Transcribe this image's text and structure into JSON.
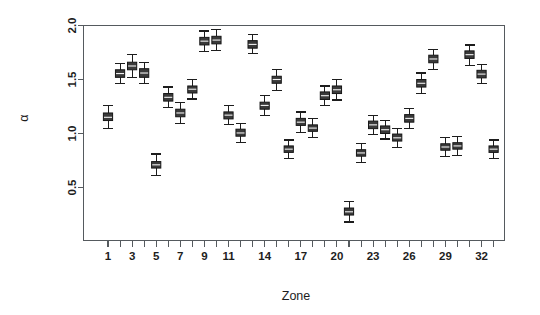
{
  "chart_data": {
    "type": "box",
    "title": "",
    "subtitle": "",
    "xlabel": "Zone",
    "ylabel": "α",
    "xlim": [
      0.5,
      33.5
    ],
    "ylim": [
      0.1,
      2.05
    ],
    "grid": false,
    "legend": null,
    "y_ticks": [
      0.5,
      1.0,
      1.5,
      2.0
    ],
    "y_tick_labels": [
      "0.5",
      "1.0",
      "1.5",
      "2.0"
    ],
    "x_ticks": [
      1,
      2,
      3,
      4,
      5,
      6,
      7,
      8,
      9,
      10,
      11,
      12,
      13,
      14,
      15,
      16,
      17,
      18,
      19,
      20,
      21,
      22,
      23,
      24,
      25,
      26,
      27,
      28,
      29,
      30,
      31,
      32,
      33
    ],
    "x_tick_labels": [
      "1",
      "",
      "3",
      "",
      "5",
      "",
      "7",
      "",
      "9",
      "",
      "11",
      "",
      "",
      "14",
      "",
      "",
      "17",
      "",
      "",
      "20",
      "",
      "",
      "23",
      "",
      "",
      "26",
      "",
      "",
      "29",
      "",
      "",
      "32",
      ""
    ],
    "categories": [
      "1",
      "2",
      "3",
      "4",
      "5",
      "6",
      "7",
      "8",
      "9",
      "10",
      "11",
      "12",
      "13",
      "14",
      "15",
      "16",
      "17",
      "18",
      "19",
      "20",
      "21",
      "22",
      "23",
      "24",
      "25",
      "26",
      "27",
      "28",
      "29",
      "30",
      "31",
      "32",
      "33"
    ],
    "boxes": [
      {
        "zone": 1,
        "lower_whisker": 1.05,
        "q1": 1.12,
        "median": 1.15,
        "q3": 1.19,
        "upper_whisker": 1.26
      },
      {
        "zone": 2,
        "lower_whisker": 1.46,
        "q1": 1.52,
        "median": 1.555,
        "q3": 1.59,
        "upper_whisker": 1.65
      },
      {
        "zone": 3,
        "lower_whisker": 1.52,
        "q1": 1.59,
        "median": 1.625,
        "q3": 1.66,
        "upper_whisker": 1.73
      },
      {
        "zone": 4,
        "lower_whisker": 1.46,
        "q1": 1.52,
        "median": 1.56,
        "q3": 1.6,
        "upper_whisker": 1.66
      },
      {
        "zone": 5,
        "lower_whisker": 0.61,
        "q1": 0.68,
        "median": 0.71,
        "q3": 0.74,
        "upper_whisker": 0.81
      },
      {
        "zone": 6,
        "lower_whisker": 1.24,
        "q1": 1.3,
        "median": 1.335,
        "q3": 1.37,
        "upper_whisker": 1.43
      },
      {
        "zone": 7,
        "lower_whisker": 1.09,
        "q1": 1.155,
        "median": 1.19,
        "q3": 1.225,
        "upper_whisker": 1.29
      },
      {
        "zone": 8,
        "lower_whisker": 1.32,
        "q1": 1.375,
        "median": 1.41,
        "q3": 1.44,
        "upper_whisker": 1.5
      },
      {
        "zone": 9,
        "lower_whisker": 1.76,
        "q1": 1.82,
        "median": 1.855,
        "q3": 1.89,
        "upper_whisker": 1.95
      },
      {
        "zone": 10,
        "lower_whisker": 1.77,
        "q1": 1.83,
        "median": 1.865,
        "q3": 1.9,
        "upper_whisker": 1.96
      },
      {
        "zone": 11,
        "lower_whisker": 1.08,
        "q1": 1.135,
        "median": 1.17,
        "q3": 1.2,
        "upper_whisker": 1.26
      },
      {
        "zone": 12,
        "lower_whisker": 0.92,
        "q1": 0.975,
        "median": 1.005,
        "q3": 1.04,
        "upper_whisker": 1.09
      },
      {
        "zone": 13,
        "lower_whisker": 1.74,
        "q1": 1.79,
        "median": 1.825,
        "q3": 1.86,
        "upper_whisker": 1.92
      },
      {
        "zone": 14,
        "lower_whisker": 1.17,
        "q1": 1.225,
        "median": 1.26,
        "q3": 1.29,
        "upper_whisker": 1.35
      },
      {
        "zone": 15,
        "lower_whisker": 1.4,
        "q1": 1.465,
        "median": 1.5,
        "q3": 1.53,
        "upper_whisker": 1.59
      },
      {
        "zone": 16,
        "lower_whisker": 0.77,
        "q1": 0.825,
        "median": 0.855,
        "q3": 0.885,
        "upper_whisker": 0.94
      },
      {
        "zone": 17,
        "lower_whisker": 1.01,
        "q1": 1.075,
        "median": 1.105,
        "q3": 1.14,
        "upper_whisker": 1.2
      },
      {
        "zone": 18,
        "lower_whisker": 0.96,
        "q1": 1.02,
        "median": 1.05,
        "q3": 1.08,
        "upper_whisker": 1.14
      },
      {
        "zone": 19,
        "lower_whisker": 1.26,
        "q1": 1.315,
        "median": 1.35,
        "q3": 1.385,
        "upper_whisker": 1.44
      },
      {
        "zone": 20,
        "lower_whisker": 1.31,
        "q1": 1.37,
        "median": 1.405,
        "q3": 1.44,
        "upper_whisker": 1.5
      },
      {
        "zone": 21,
        "lower_whisker": 0.18,
        "q1": 0.245,
        "median": 0.275,
        "q3": 0.31,
        "upper_whisker": 0.37
      },
      {
        "zone": 22,
        "lower_whisker": 0.73,
        "q1": 0.79,
        "median": 0.82,
        "q3": 0.85,
        "upper_whisker": 0.91
      },
      {
        "zone": 23,
        "lower_whisker": 0.99,
        "q1": 1.045,
        "median": 1.08,
        "q3": 1.115,
        "upper_whisker": 1.17
      },
      {
        "zone": 24,
        "lower_whisker": 0.95,
        "q1": 1.0,
        "median": 1.035,
        "q3": 1.07,
        "upper_whisker": 1.12
      },
      {
        "zone": 25,
        "lower_whisker": 0.87,
        "q1": 0.93,
        "median": 0.96,
        "q3": 0.995,
        "upper_whisker": 1.05
      },
      {
        "zone": 26,
        "lower_whisker": 1.05,
        "q1": 1.105,
        "median": 1.14,
        "q3": 1.175,
        "upper_whisker": 1.23
      },
      {
        "zone": 27,
        "lower_whisker": 1.37,
        "q1": 1.43,
        "median": 1.465,
        "q3": 1.5,
        "upper_whisker": 1.56
      },
      {
        "zone": 28,
        "lower_whisker": 1.59,
        "q1": 1.655,
        "median": 1.69,
        "q3": 1.725,
        "upper_whisker": 1.78
      },
      {
        "zone": 29,
        "lower_whisker": 0.79,
        "q1": 0.845,
        "median": 0.875,
        "q3": 0.905,
        "upper_whisker": 0.96
      },
      {
        "zone": 30,
        "lower_whisker": 0.8,
        "q1": 0.855,
        "median": 0.885,
        "q3": 0.915,
        "upper_whisker": 0.97
      },
      {
        "zone": 31,
        "lower_whisker": 1.63,
        "q1": 1.695,
        "median": 1.73,
        "q3": 1.765,
        "upper_whisker": 1.82
      },
      {
        "zone": 32,
        "lower_whisker": 1.46,
        "q1": 1.515,
        "median": 1.55,
        "q3": 1.585,
        "upper_whisker": 1.64
      },
      {
        "zone": 33,
        "lower_whisker": 0.77,
        "q1": 0.825,
        "median": 0.855,
        "q3": 0.885,
        "upper_whisker": 0.94
      }
    ],
    "colors": {
      "box_fill": "#3a3a3a",
      "box_stroke": "#161616",
      "median": "#f2f2f2",
      "axis": "#555a5e",
      "text": "#1d1d1d",
      "background": "#ffffff"
    }
  }
}
